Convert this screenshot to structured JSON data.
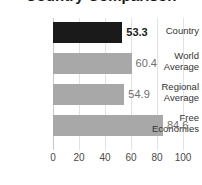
{
  "chart_data": {
    "type": "bar",
    "orientation": "horizontal",
    "title": "Country Comparison",
    "xlabel": "",
    "ylabel": "",
    "categories": [
      "Country",
      "World Average",
      "Regional Average",
      "Free Economies"
    ],
    "values": [
      53.3,
      60.4,
      54.9,
      84.6
    ],
    "value_labels": [
      "53.3",
      "60.4",
      "54.9",
      "84.6"
    ],
    "xlim": [
      0,
      100
    ],
    "xticks": [
      0,
      20,
      40,
      60,
      80,
      100
    ],
    "xtick_labels": [
      "0",
      "20",
      "40",
      "60",
      "80",
      "100"
    ],
    "grid": true,
    "legend": false,
    "bar_colors": [
      "#1a1a1a",
      "#a8a8a8",
      "#a8a8a8",
      "#a8a8a8"
    ],
    "highlight_index": 0,
    "category_lines": [
      [
        "Country"
      ],
      [
        "World",
        "Average"
      ],
      [
        "Regional",
        "Average"
      ],
      [
        "Free",
        "Economies"
      ]
    ],
    "colors": {
      "highlight_bar": "#1a1a1a",
      "default_bar": "#a8a8a8",
      "gridline": "#e2e2e2",
      "axis": "#c9c9c9",
      "value_text": "#6e6e6e",
      "value_text_emph": "#1a1a1a",
      "category_text": "#333333",
      "tick_text": "#4a4a4a",
      "background": "#ffffff"
    }
  }
}
